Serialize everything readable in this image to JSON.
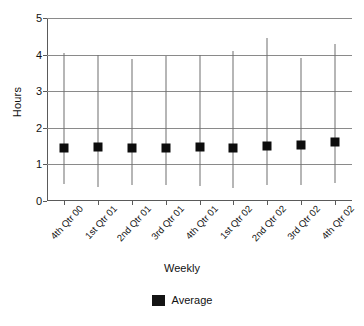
{
  "chart_data": {
    "type": "scatter",
    "title": "",
    "xlabel": "Weekly",
    "ylabel": "Hours",
    "ylim": [
      0,
      5
    ],
    "yticks": [
      0,
      1,
      2,
      3,
      4,
      5
    ],
    "grid": true,
    "legend_position": "bottom",
    "legend": [
      "Average"
    ],
    "categories": [
      "4th Qtr 00",
      "1st Qtr 01",
      "2nd Qtr 01",
      "3rd Qtr 01",
      "4th Qtr 01",
      "1st Qtr 02",
      "2nd Qtr 02",
      "3rd Qtr 02",
      "4th Qtr 02"
    ],
    "series": [
      {
        "name": "Average",
        "marker": "square",
        "color": "#0d0d0d",
        "values": [
          1.44,
          1.47,
          1.44,
          1.45,
          1.47,
          1.45,
          1.51,
          1.52,
          1.6
        ]
      }
    ],
    "error_bars": {
      "upper": [
        4.05,
        4.0,
        3.87,
        3.97,
        4.0,
        4.1,
        4.45,
        3.9,
        4.3
      ],
      "lower": [
        0.47,
        0.38,
        0.43,
        0.43,
        0.4,
        0.35,
        0.43,
        0.45,
        0.5
      ]
    }
  },
  "axes": {
    "ylabel": "Hours",
    "xlabel": "Weekly"
  },
  "legend": {
    "items": [
      {
        "label": "Average",
        "color": "#141414",
        "marker": "square"
      }
    ]
  }
}
